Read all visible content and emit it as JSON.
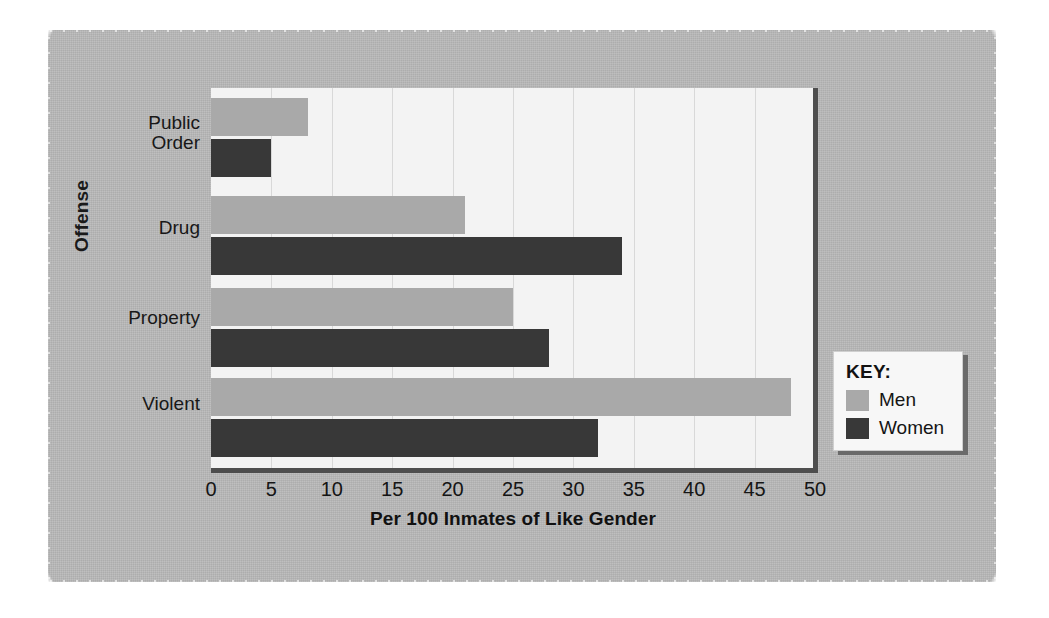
{
  "chart_data": {
    "type": "bar",
    "orientation": "horizontal",
    "title": "",
    "xlabel": "Per 100 Inmates of Like Gender",
    "ylabel": "Offense",
    "categories": [
      "Violent",
      "Property",
      "Drug",
      "Public Order"
    ],
    "series": [
      {
        "name": "Men",
        "color": "#a9a9a9",
        "values": [
          48,
          25,
          21,
          8
        ]
      },
      {
        "name": "Women",
        "color": "#383838",
        "values": [
          32,
          28,
          34,
          5
        ]
      }
    ],
    "xlim": [
      0,
      50
    ],
    "xticks": [
      "0",
      "5",
      "10",
      "15",
      "20",
      "25",
      "30",
      "35",
      "40",
      "45",
      "50"
    ],
    "xtick_values": [
      0,
      5,
      10,
      15,
      20,
      25,
      30,
      35,
      40,
      45,
      50
    ],
    "grid": "vertical",
    "legend_position": "right-outside"
  },
  "legend": {
    "title": "KEY:",
    "entries": [
      {
        "label": "Men",
        "color": "#a9a9a9"
      },
      {
        "label": "Women",
        "color": "#383838"
      }
    ]
  },
  "category_labels": [
    {
      "line1": "Public",
      "line2": "Order"
    },
    {
      "line1": "Drug",
      "line2": ""
    },
    {
      "line1": "Property",
      "line2": ""
    },
    {
      "line1": "Violent",
      "line2": ""
    }
  ],
  "colors": {
    "page_background": "#ffffff",
    "panel_background": "#b9b9b9",
    "plot_background": "#f3f3f3",
    "gridline": "#d8d8d8",
    "axis_rule": "#4e4e4e",
    "men_bar": "#a9a9a9",
    "women_bar": "#383838",
    "text": "#151515"
  }
}
